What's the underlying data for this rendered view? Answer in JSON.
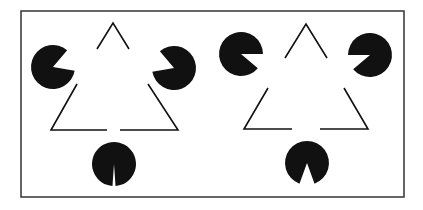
{
  "figure": {
    "title": "Kanizsa triangle illusion comparison",
    "background": "#ffffff",
    "ink": "#111111",
    "frame": {
      "x": 21,
      "y": 11,
      "width": 383,
      "height": 186,
      "stroke": "#333333"
    },
    "panels": [
      {
        "name": "left-kanizsa",
        "pacmen": [
          {
            "cx": 53,
            "cy": 67,
            "r": 22,
            "mouth_dir_deg": 20,
            "mouth_width_deg": 60
          },
          {
            "cx": 174,
            "cy": 68,
            "r": 22,
            "mouth_dir_deg": 160,
            "mouth_width_deg": 60
          },
          {
            "cx": 114,
            "cy": 164,
            "r": 22,
            "mouth_dir_deg": 270,
            "mouth_width_deg": 8
          }
        ],
        "line_segments": [
          [
            [
              97,
              49
            ],
            [
              113,
              23
            ],
            [
              129,
              49
            ]
          ],
          [
            [
              77,
              84
            ],
            [
              51,
              130
            ],
            [
              107,
              130
            ]
          ],
          [
            [
              148,
              84
            ],
            [
              178,
              130
            ],
            [
              120,
              130
            ]
          ]
        ]
      },
      {
        "name": "right-kanizsa",
        "pacmen": [
          {
            "cx": 241,
            "cy": 54,
            "r": 22,
            "mouth_dir_deg": -20,
            "mouth_width_deg": 40
          },
          {
            "cx": 370,
            "cy": 55,
            "r": 22,
            "mouth_dir_deg": 200,
            "mouth_width_deg": 40
          },
          {
            "cx": 307,
            "cy": 163,
            "r": 22,
            "mouth_dir_deg": 270,
            "mouth_width_deg": 40
          }
        ],
        "line_segments": [
          [
            [
              285,
              58
            ],
            [
              306,
              24
            ],
            [
              327,
              58
            ]
          ],
          [
            [
              268,
              88
            ],
            [
              244,
              129
            ],
            [
              292,
              129
            ]
          ],
          [
            [
              344,
              88
            ],
            [
              368,
              129
            ],
            [
              320,
              129
            ]
          ]
        ]
      }
    ]
  }
}
